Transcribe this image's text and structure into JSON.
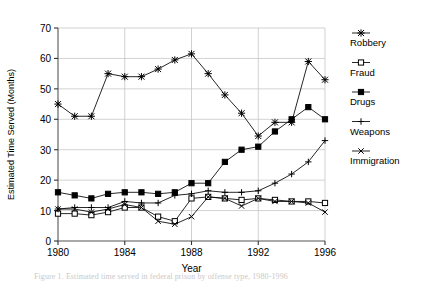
{
  "figure": {
    "background_color": "#ffffff",
    "caption_partial": "Figure 1.  Estimated time served in federal prison by offense type, 1980-1996"
  },
  "chart_data": {
    "type": "line",
    "title": "",
    "xlabel": "Year",
    "ylabel": "Estimated Time Served (Months)",
    "xlim": [
      1980,
      1996
    ],
    "ylim": [
      0,
      70
    ],
    "xticks": [
      1980,
      1984,
      1988,
      1992,
      1996
    ],
    "yticks": [
      0,
      10,
      20,
      30,
      40,
      50,
      60,
      70
    ],
    "xtick_labels": [
      "1980",
      "1984",
      "1988",
      "1992",
      "1996"
    ],
    "ytick_labels": [
      "0",
      "10",
      "20",
      "30",
      "40",
      "50",
      "60",
      "70"
    ],
    "grid": true,
    "grid_color": "#bfbfbf",
    "legend_position": "right",
    "line_color": "#000000",
    "x": [
      1980,
      1981,
      1982,
      1983,
      1984,
      1985,
      1986,
      1987,
      1988,
      1989,
      1990,
      1991,
      1992,
      1993,
      1994,
      1995,
      1996
    ],
    "series": [
      {
        "name": "Robbery",
        "marker": "asterisk",
        "marker_fill": "none",
        "values": [
          45,
          41,
          41,
          55,
          54,
          54,
          56.5,
          59.5,
          61.5,
          55,
          48,
          42,
          34.5,
          39,
          39,
          59,
          53
        ]
      },
      {
        "name": "Fraud",
        "marker": "open-square",
        "marker_fill": "#ffffff",
        "values": [
          9,
          9,
          8.5,
          9.5,
          11,
          11,
          8,
          6.5,
          14,
          14.5,
          14,
          13.5,
          14,
          13.5,
          13,
          13,
          12.5
        ]
      },
      {
        "name": "Drugs",
        "marker": "filled-square",
        "marker_fill": "#000000",
        "values": [
          16,
          15,
          14,
          15.5,
          16,
          16,
          15.5,
          16,
          19,
          19,
          26,
          30,
          31,
          36,
          40,
          44,
          40
        ]
      },
      {
        "name": "Weapons",
        "marker": "plus",
        "marker_fill": "none",
        "values": [
          10.5,
          11,
          11,
          11,
          13,
          12.5,
          12.5,
          15,
          15.5,
          16.5,
          16,
          16,
          16.5,
          19,
          22,
          26,
          33
        ]
      },
      {
        "name": "Immigration",
        "marker": "cross",
        "marker_fill": "none",
        "values": [
          10.5,
          10.5,
          9.5,
          10.5,
          12,
          11,
          6.5,
          5.5,
          8,
          14.5,
          14,
          11.5,
          14,
          13,
          13,
          12.5,
          9.5
        ]
      }
    ]
  }
}
